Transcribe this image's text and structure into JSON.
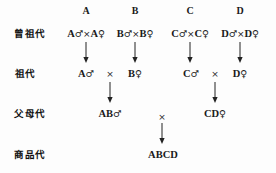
{
  "diagram": {
    "generation_labels": [
      {
        "text": "曾祖代",
        "x": 30,
        "y": 34
      },
      {
        "text": "祖代",
        "x": 25,
        "y": 74
      },
      {
        "text": "父母代",
        "x": 30,
        "y": 114
      },
      {
        "text": "商品代",
        "x": 30,
        "y": 155
      }
    ],
    "column_headers": [
      {
        "text": "A",
        "x": 86,
        "y": 11
      },
      {
        "text": "B",
        "x": 135,
        "y": 11
      },
      {
        "text": "C",
        "x": 190,
        "y": 11
      },
      {
        "text": "D",
        "x": 240,
        "y": 11
      }
    ],
    "row1_pairs": [
      {
        "male": "A",
        "female": "A",
        "male_symbol": "♂",
        "female_symbol": "♀",
        "operator": "×",
        "x": 86,
        "y": 34
      },
      {
        "male": "B",
        "female": "B",
        "male_symbol": "♂",
        "female_symbol": "♀",
        "operator": "×",
        "x": 135,
        "y": 34
      },
      {
        "male": "C",
        "female": "C",
        "male_symbol": "♂",
        "female_symbol": "♀",
        "operator": "×",
        "x": 190,
        "y": 34
      },
      {
        "male": "D",
        "female": "D",
        "male_symbol": "♂",
        "female_symbol": "♀",
        "operator": "×",
        "x": 240,
        "y": 34
      }
    ],
    "row2_nodes": [
      {
        "text": "A",
        "symbol": "♂",
        "x": 86,
        "y": 74
      },
      {
        "text": "B",
        "symbol": "♀",
        "x": 135,
        "y": 74
      },
      {
        "text": "C",
        "symbol": "♂",
        "x": 191,
        "y": 74
      },
      {
        "text": "D",
        "symbol": "♀",
        "x": 240,
        "y": 74
      }
    ],
    "row2_operators": [
      {
        "text": "×",
        "x": 110,
        "y": 74
      },
      {
        "text": "×",
        "x": 215,
        "y": 74
      }
    ],
    "row3_nodes": [
      {
        "text": "AB",
        "symbol": "♂",
        "x": 110,
        "y": 114
      },
      {
        "text": "CD",
        "symbol": "♀",
        "x": 215,
        "y": 114
      }
    ],
    "row3_operators": [
      {
        "text": "×",
        "x": 162,
        "y": 117
      }
    ],
    "row4_nodes": [
      {
        "text": "ABCD",
        "symbol": "",
        "x": 163,
        "y": 155
      }
    ],
    "arrows": [
      {
        "x": 86,
        "y": 42,
        "length": 22
      },
      {
        "x": 135,
        "y": 42,
        "length": 22
      },
      {
        "x": 190,
        "y": 42,
        "length": 22
      },
      {
        "x": 240,
        "y": 42,
        "length": 22
      },
      {
        "x": 110,
        "y": 82,
        "length": 22
      },
      {
        "x": 215,
        "y": 82,
        "length": 22
      },
      {
        "x": 162,
        "y": 123,
        "length": 22
      }
    ],
    "colors": {
      "ink": "#1a1a1a",
      "background": "#fdfdfd",
      "arrow": "#222222"
    }
  }
}
